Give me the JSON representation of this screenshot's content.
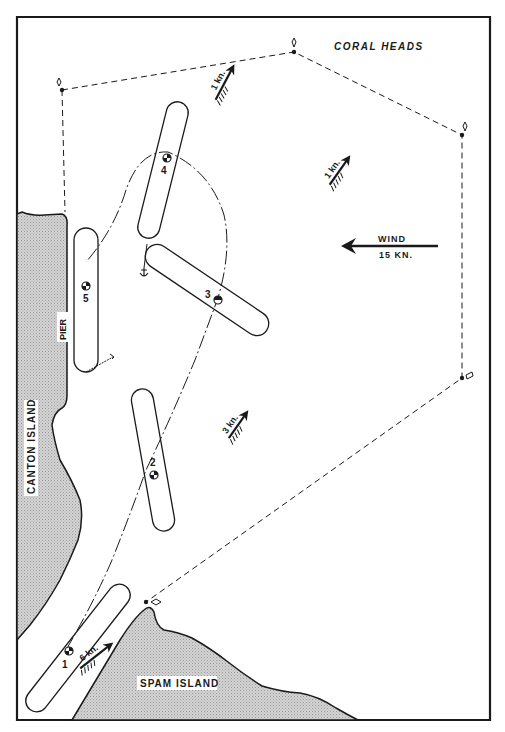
{
  "map": {
    "title": "Ship maneuvering diagram near Canton Island pier",
    "colors": {
      "ink": "#1a1a1a",
      "land": "#c9c9c9",
      "background": "#ffffff"
    },
    "landmasses": [
      {
        "id": "canton",
        "label": "CANTON ISLAND"
      },
      {
        "id": "spam",
        "label": "SPAM ISLAND"
      }
    ],
    "pier_label": "PIER",
    "coral_label": "CORAL HEADS",
    "wind": {
      "label": "WIND",
      "speed": "15 KN.",
      "direction": "west"
    },
    "currents": [
      {
        "id": "current-top",
        "label": "1 kn."
      },
      {
        "id": "current-mid",
        "label": "1 kn."
      },
      {
        "id": "current-channel",
        "label": "3 kn."
      },
      {
        "id": "current-entrance",
        "label": "6 kn."
      }
    ],
    "ship_positions": [
      {
        "number": "1"
      },
      {
        "number": "2"
      },
      {
        "number": "3"
      },
      {
        "number": "4"
      },
      {
        "number": "5"
      }
    ],
    "buoy_markers": 5,
    "anchor_symbols": 1
  }
}
